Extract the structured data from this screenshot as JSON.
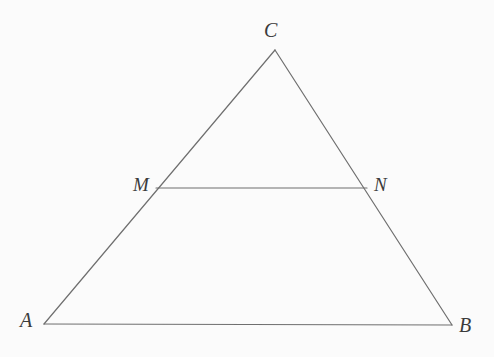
{
  "figure": {
    "kind": "geometry-diagram",
    "background_color": "#fbfbfb",
    "stroke_color": "#6f6f6f",
    "label_color": "#3b3b3b",
    "stroke_width": 1.2,
    "canvas": {
      "width": 494,
      "height": 357
    }
  },
  "points": {
    "A": {
      "label": "A",
      "x": 44,
      "y": 324
    },
    "B": {
      "label": "B",
      "x": 452,
      "y": 325
    },
    "C": {
      "label": "C",
      "x": 275,
      "y": 50
    },
    "M": {
      "label": "M",
      "x": 156,
      "y": 188
    },
    "N": {
      "label": "N",
      "x": 367,
      "y": 188
    }
  },
  "segments": [
    {
      "name": "side-AC",
      "from": "A",
      "to": "C"
    },
    {
      "name": "side-CB",
      "from": "C",
      "to": "B"
    },
    {
      "name": "side-AB",
      "from": "A",
      "to": "B"
    },
    {
      "name": "midsegment-MN",
      "from": "M",
      "to": "N"
    }
  ],
  "labels": {
    "A": "A",
    "B": "B",
    "C": "C",
    "M": "M",
    "N": "N"
  }
}
